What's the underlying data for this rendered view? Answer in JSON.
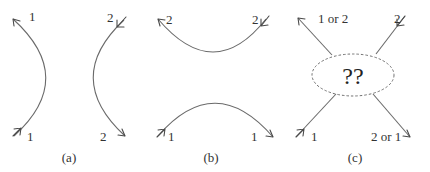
{
  "diagram": {
    "colors": {
      "line": "#6a6a6a",
      "arrow": "#4a4a4a",
      "text": "#333333",
      "background": "#ffffff"
    },
    "panels": [
      {
        "id": "a",
        "caption": "(a)",
        "paths": [
          {
            "name": "particle-1-path",
            "start_label": "1",
            "end_label": "1",
            "shape": "curve bulging right"
          },
          {
            "name": "particle-2-path",
            "start_label": "2",
            "end_label": "2",
            "shape": "curve bulging left"
          }
        ]
      },
      {
        "id": "b",
        "caption": "(b)",
        "paths": [
          {
            "name": "particle-2-path",
            "start_label": "2",
            "end_label": "2",
            "shape": "curve dipping down"
          },
          {
            "name": "particle-1-path",
            "start_label": "1",
            "end_label": "1",
            "shape": "curve arching up"
          }
        ]
      },
      {
        "id": "c",
        "caption": "(c)",
        "center_label": "??",
        "legs": [
          {
            "name": "outgoing-top-left",
            "label": "1 or 2"
          },
          {
            "name": "incoming-top-right",
            "label": "2"
          },
          {
            "name": "incoming-bottom-left",
            "label": "1"
          },
          {
            "name": "outgoing-bottom-right",
            "label": "2 or 1"
          }
        ]
      }
    ]
  }
}
